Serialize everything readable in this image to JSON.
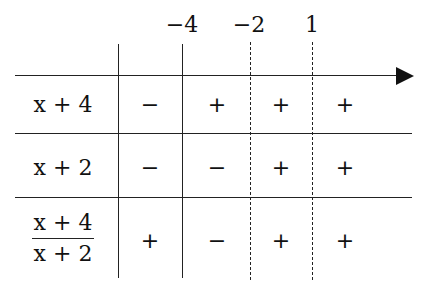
{
  "axis": {
    "critical_values": [
      "−4",
      "−2",
      "1"
    ]
  },
  "rows": [
    {
      "label": "x + 4",
      "signs": [
        "−",
        "+",
        "+",
        "+"
      ]
    },
    {
      "label": "x + 2",
      "signs": [
        "−",
        "−",
        "+",
        "+"
      ]
    },
    {
      "label_numerator": "x + 4",
      "label_denominator": "x + 2",
      "signs": [
        "+",
        "−",
        "+",
        "+"
      ]
    }
  ]
}
